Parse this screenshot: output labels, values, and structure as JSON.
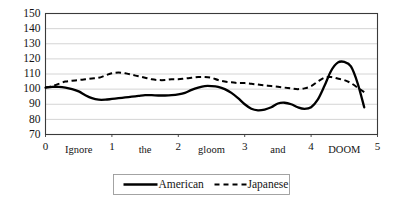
{
  "chart_data": {
    "type": "line",
    "title": "",
    "subtitle": "",
    "xlabel": "",
    "ylabel": "",
    "xlim": [
      0,
      5
    ],
    "ylim": [
      70,
      150
    ],
    "grid": true,
    "legend_position": "bottom",
    "y_ticks": [
      150,
      140,
      130,
      120,
      110,
      100,
      90,
      80,
      70
    ],
    "x_ticks": [
      0,
      1,
      2,
      3,
      4,
      5
    ],
    "x_tick_labels": [
      "0",
      "1",
      "2",
      "3",
      "4",
      "5"
    ],
    "x_annotations": [
      {
        "x": 0.5,
        "text": "Ignore"
      },
      {
        "x": 1.5,
        "text": "the"
      },
      {
        "x": 2.5,
        "text": "gloom"
      },
      {
        "x": 3.5,
        "text": "and"
      },
      {
        "x": 4.5,
        "text": "DOOM"
      }
    ],
    "series": [
      {
        "name": "American",
        "style": "solid",
        "color": "#000000",
        "x": [
          0.0,
          0.1,
          0.2,
          0.3,
          0.4,
          0.5,
          0.6,
          0.7,
          0.8,
          0.9,
          1.0,
          1.1,
          1.2,
          1.3,
          1.4,
          1.5,
          1.6,
          1.7,
          1.8,
          1.9,
          2.0,
          2.1,
          2.2,
          2.3,
          2.4,
          2.5,
          2.6,
          2.7,
          2.8,
          2.9,
          3.0,
          3.1,
          3.2,
          3.3,
          3.4,
          3.5,
          3.6,
          3.7,
          3.8,
          3.9,
          4.0,
          4.1,
          4.2,
          4.3,
          4.4,
          4.5,
          4.6,
          4.7,
          4.8
        ],
        "values": [
          101,
          101.5,
          101.5,
          101,
          100,
          98.5,
          96,
          94,
          93,
          93,
          93.5,
          94,
          94.5,
          95,
          95.5,
          96,
          96,
          95.8,
          95.8,
          96,
          96.5,
          97.5,
          99.5,
          101,
          102,
          102,
          101.5,
          100,
          97.5,
          94,
          90,
          87,
          86,
          86.5,
          88,
          90.5,
          91,
          90,
          88,
          87,
          88,
          93,
          102,
          112,
          117.5,
          118,
          115,
          104,
          88
        ]
      },
      {
        "name": "Japanese",
        "style": "dashed",
        "color": "#000000",
        "x": [
          0.0,
          0.1,
          0.2,
          0.3,
          0.4,
          0.5,
          0.6,
          0.7,
          0.8,
          0.9,
          1.0,
          1.1,
          1.2,
          1.3,
          1.4,
          1.5,
          1.6,
          1.7,
          1.8,
          1.9,
          2.0,
          2.1,
          2.2,
          2.3,
          2.4,
          2.5,
          2.6,
          2.7,
          2.8,
          2.9,
          3.0,
          3.1,
          3.2,
          3.3,
          3.4,
          3.5,
          3.6,
          3.7,
          3.8,
          3.9,
          4.0,
          4.1,
          4.2,
          4.3,
          4.4,
          4.5,
          4.6,
          4.7,
          4.8
        ],
        "values": [
          101,
          102,
          103.5,
          105,
          105.5,
          106,
          106.5,
          107,
          107.5,
          109,
          110.5,
          111,
          110.5,
          109.5,
          108.5,
          107.5,
          106.5,
          106,
          106,
          106.5,
          106.5,
          107,
          107.5,
          108,
          108,
          107.5,
          106,
          105,
          104.5,
          104,
          104,
          103.5,
          103,
          102.5,
          102,
          101.5,
          101,
          100.5,
          100,
          100.5,
          102,
          105,
          107.5,
          108,
          107,
          106,
          104,
          101,
          98
        ]
      }
    ]
  },
  "legend": {
    "items": [
      {
        "label": "American",
        "style": "solid"
      },
      {
        "label": "Japanese",
        "style": "dashed"
      }
    ]
  }
}
